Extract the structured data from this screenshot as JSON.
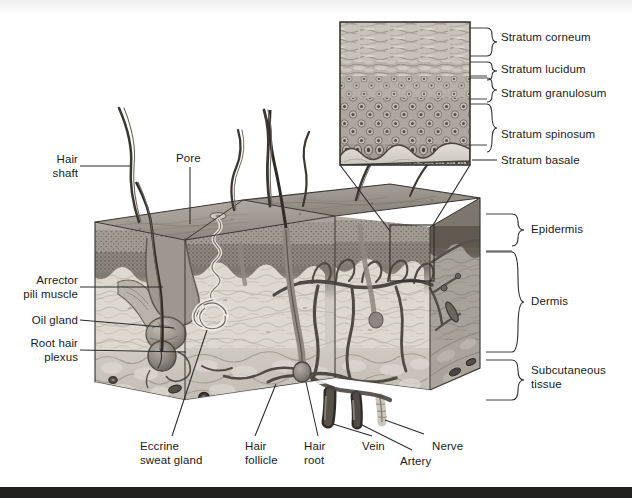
{
  "figure": {
    "type": "anatomical-illustration",
    "style": "grayscale pen-and-ink / airbrush textbook plate"
  },
  "inset": {
    "title": "Epidermis histology magnification",
    "layers": [
      {
        "id": "corneum",
        "label": "Stratum corneum",
        "marker": "brace"
      },
      {
        "id": "lucidum",
        "label": "Stratum lucidum",
        "marker": "brace"
      },
      {
        "id": "granulosum",
        "label": "Stratum granulosum",
        "marker": "brace"
      },
      {
        "id": "spinosum",
        "label": "Stratum spinosum",
        "marker": "brace"
      },
      {
        "id": "basale",
        "label": "Stratum basale",
        "marker": "line"
      }
    ]
  },
  "left_labels": [
    {
      "id": "hair-shaft",
      "label": "Hair\nshaft"
    },
    {
      "id": "arrector-pili",
      "label": "Arrector\npili muscle"
    },
    {
      "id": "oil-gland",
      "label": "Oil gland"
    },
    {
      "id": "root-hair-plexus",
      "label": "Root hair\nplexus"
    }
  ],
  "top_labels": [
    {
      "id": "pore",
      "label": "Pore"
    }
  ],
  "bottom_labels": [
    {
      "id": "eccrine-sweat-gland",
      "label": "Eccrine\nsweat gland"
    },
    {
      "id": "hair-follicle",
      "label": "Hair\nfollicle"
    },
    {
      "id": "hair-root",
      "label": "Hair\nroot"
    },
    {
      "id": "vein",
      "label": "Vein"
    },
    {
      "id": "artery",
      "label": "Artery"
    },
    {
      "id": "nerve",
      "label": "Nerve"
    }
  ],
  "right_labels": [
    {
      "id": "epidermis",
      "label": "Epidermis",
      "marker": "brace"
    },
    {
      "id": "dermis",
      "label": "Dermis",
      "marker": "brace"
    },
    {
      "id": "subcutaneous",
      "label": "Subcutaneous\ntissue",
      "marker": "brace"
    }
  ],
  "colors": {
    "ink": "#1a1a1a",
    "leader": "#2b2b2b",
    "page": "#ffffff",
    "epidermis_top": "#9a948d",
    "epidermis_band": "#6e6862",
    "dermis": "#d8d4cc",
    "dermis_shaded": "#a9a49c",
    "subcutaneous": "#c9c4bb",
    "vessel": "#4a4641",
    "hair": "#3b3733",
    "scanbar": "#23211f"
  }
}
